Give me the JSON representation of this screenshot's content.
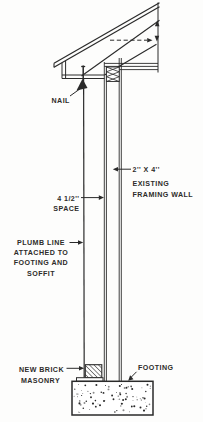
{
  "diagram": {
    "colors": {
      "ink": "#2a2a2a",
      "paper": "#fdfdfc"
    },
    "labels": {
      "nail": "NAIL",
      "two_by_four": "2'' X 4''",
      "existing_line1": "EXISTING",
      "existing_line2": "FRAMING WALL",
      "space_line1": "4 1/2''",
      "space_line2": "SPACE",
      "plumb_line1": "PLUMB LINE",
      "plumb_line2": "ATTACHED TO",
      "plumb_line3": "FOOTING AND",
      "plumb_line4": "SOFFIT",
      "brick_line1": "NEW BRICK",
      "brick_line2": "MASONRY",
      "footing": "FOOTING"
    }
  }
}
